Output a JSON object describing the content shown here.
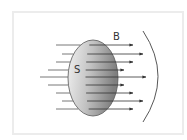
{
  "diagram": {
    "labels": {
      "field": "B",
      "surface": "S"
    },
    "colors": {
      "frame_border": "#ececec",
      "surface_light": "#eeeeee",
      "surface_dark": "#8a8a8a",
      "line": "#333333"
    },
    "surface": {
      "cx": 93,
      "cy": 78,
      "rx": 25,
      "ry": 38
    },
    "field_lines": [
      {
        "y": 45,
        "x1": 56,
        "x2": 133
      },
      {
        "y": 54,
        "x1": 62,
        "x2": 143
      },
      {
        "y": 62,
        "x1": 56,
        "x2": 133
      },
      {
        "y": 70,
        "x1": 48,
        "x2": 124
      },
      {
        "y": 77,
        "x1": 40,
        "x2": 146
      },
      {
        "y": 85,
        "x1": 48,
        "x2": 124
      },
      {
        "y": 93,
        "x1": 56,
        "x2": 133
      },
      {
        "y": 101,
        "x1": 62,
        "x2": 143
      },
      {
        "y": 109,
        "x1": 56,
        "x2": 133
      }
    ],
    "boundary_arc": {
      "x_top": 143,
      "y_top": 31,
      "x_bottom": 143,
      "y_bottom": 122,
      "bulge_x": 158
    }
  }
}
